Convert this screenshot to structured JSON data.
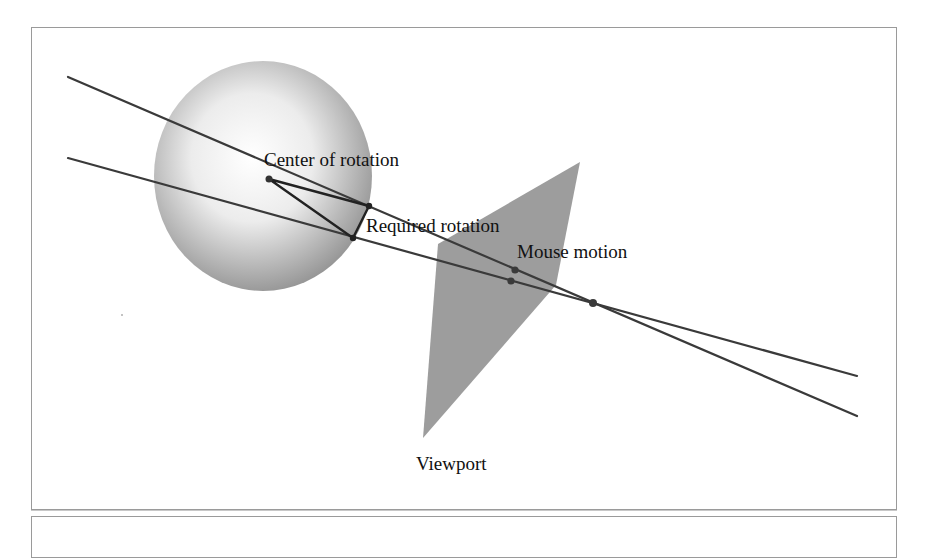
{
  "diagram": {
    "title": "",
    "labels": {
      "center": "Center of rotation",
      "rotation": "Required rotation",
      "mouse": "Mouse motion",
      "viewport": "Viewport"
    },
    "colors": {
      "line": "#3a3a3a",
      "point": "#3a3a3a",
      "viewport_fill": "#9d9d9d",
      "sphere_light": "#ffffff",
      "sphere_dark": "#8a8a8a",
      "panel_border": "#9a9a9a"
    },
    "points": {
      "center_of_rotation": [
        269,
        179
      ],
      "rotation_upper": [
        369,
        206
      ],
      "rotation_lower": [
        353,
        238
      ],
      "mouse_upper": [
        515,
        270
      ],
      "mouse_lower": [
        511,
        281
      ],
      "eye_convergence": [
        593,
        303
      ]
    },
    "sphere": {
      "cx": 263,
      "cy": 176,
      "rx": 109,
      "ry": 115
    },
    "viewport_polygon": [
      [
        438,
        244
      ],
      [
        580,
        162
      ],
      [
        556,
        285
      ],
      [
        423,
        438
      ]
    ],
    "rays": [
      {
        "name": "upper-ray",
        "from": [
          68,
          77
        ],
        "to": [
          857,
          416
        ]
      },
      {
        "name": "lower-ray",
        "from": [
          68,
          158
        ],
        "to": [
          857,
          376
        ]
      }
    ]
  }
}
